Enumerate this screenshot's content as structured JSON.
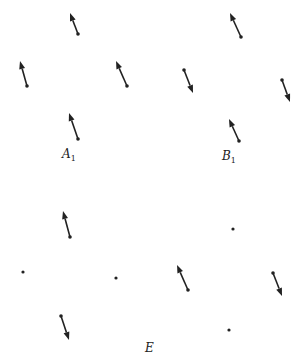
{
  "colors": {
    "stroke": "#222222",
    "background": "#ffffff"
  },
  "labels": [
    {
      "id": "A1",
      "main": "A",
      "sub": "1",
      "x": 62,
      "y": 148
    },
    {
      "id": "B1",
      "main": "B",
      "sub": "1",
      "x": 222,
      "y": 150
    },
    {
      "id": "E",
      "main": "E",
      "sub": "",
      "x": 145,
      "y": 342
    }
  ],
  "groups": [
    {
      "name": "A1",
      "arrows": [
        {
          "tail": [
            78,
            34
          ],
          "head": [
            70,
            13
          ]
        },
        {
          "tail": [
            27,
            86
          ],
          "head": [
            20,
            61
          ]
        },
        {
          "tail": [
            127,
            86
          ],
          "head": [
            116,
            61
          ]
        },
        {
          "tail": [
            78,
            139
          ],
          "head": [
            69,
            113
          ]
        }
      ],
      "dots": []
    },
    {
      "name": "B1",
      "arrows": [
        {
          "tail": [
            241,
            37
          ],
          "head": [
            230,
            13
          ]
        },
        {
          "tail": [
            184,
            70
          ],
          "head": [
            193,
            93
          ]
        },
        {
          "tail": [
            282,
            80
          ],
          "head": [
            290,
            102
          ]
        },
        {
          "tail": [
            239,
            141
          ],
          "head": [
            229,
            119
          ]
        }
      ],
      "dots": []
    },
    {
      "name": "E",
      "arrows": [
        {
          "tail": [
            70,
            237
          ],
          "head": [
            63,
            211
          ]
        },
        {
          "tail": [
            61,
            316
          ],
          "head": [
            69,
            340
          ]
        },
        {
          "tail": [
            188,
            290
          ],
          "head": [
            177,
            265
          ]
        },
        {
          "tail": [
            273,
            273
          ],
          "head": [
            282,
            296
          ]
        }
      ],
      "dots": [
        [
          23,
          272
        ],
        [
          116,
          278
        ],
        [
          233,
          229
        ],
        [
          229,
          330
        ]
      ]
    }
  ]
}
